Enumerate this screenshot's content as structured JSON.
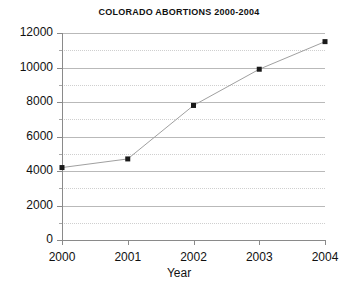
{
  "chart_data": {
    "type": "line",
    "title": "COLORADO ABORTIONS 2000-2004",
    "xlabel": "Year",
    "ylabel": "",
    "categories": [
      "2000",
      "2001",
      "2002",
      "2003",
      "2004"
    ],
    "x": [
      2000,
      2001,
      2002,
      2003,
      2004
    ],
    "values": [
      4200,
      4700,
      7800,
      9900,
      11500
    ],
    "series": [
      {
        "name": "Colorado abortions",
        "values": [
          4200,
          4700,
          7800,
          9900,
          11500
        ]
      }
    ],
    "xlim": [
      2000,
      2004
    ],
    "ylim": [
      0,
      12000
    ],
    "ytick_labels": [
      "0",
      "2000",
      "4000",
      "6000",
      "8000",
      "10000",
      "12000"
    ],
    "ytick_values": [
      0,
      2000,
      4000,
      6000,
      8000,
      10000,
      12000
    ],
    "yminor_values": [
      1000,
      3000,
      5000,
      7000,
      9000,
      11000
    ],
    "xtick_labels": [
      "2000",
      "2001",
      "2002",
      "2003",
      "2004"
    ],
    "grid": true,
    "grid_style": "solid major gray, dotted minor gray",
    "legend": "none",
    "marker": "filled square",
    "marker_color": "#1a1a1a",
    "line_color": "#a0a0a0",
    "background": "#ffffff"
  }
}
